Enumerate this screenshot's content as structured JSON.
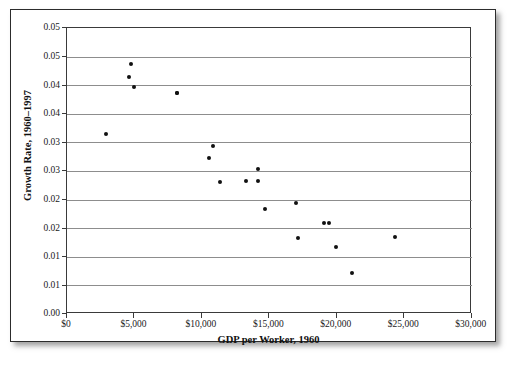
{
  "figure": {
    "frame_color": "#2c2c2c",
    "background": "#ffffff",
    "marker_color": "#111111",
    "grid_color": "#8d8d8d"
  },
  "chart_data": {
    "type": "scatter",
    "title": "",
    "xlabel": "GDP per Worker, 1960",
    "ylabel": "Growth Rate, 1960–1997",
    "xlim": [
      0,
      30000
    ],
    "ylim": [
      0.0,
      0.05
    ],
    "grid": true,
    "legend": "none",
    "xticks": [
      0,
      5000,
      10000,
      15000,
      20000,
      25000,
      30000
    ],
    "xticklabels": [
      "$0",
      "$5,000",
      "$10,000",
      "$15,000",
      "$20,000",
      "$25,000",
      "$30,000"
    ],
    "yticks": [
      0.05,
      0.045,
      0.04,
      0.035,
      0.03,
      0.025,
      0.02,
      0.015,
      0.01,
      0.005,
      0.0
    ],
    "yticklabels": [
      "0.05",
      "0.05",
      "0.04",
      "0.04",
      "0.03",
      "0.03",
      "0.02",
      "0.02",
      "0.01",
      "0.01",
      "0.00"
    ],
    "points": [
      {
        "x": 4830,
        "y": 0.0436
      },
      {
        "x": 8230,
        "y": 0.0385
      },
      {
        "x": 4690,
        "y": 0.0413
      },
      {
        "x": 5060,
        "y": 0.0396
      },
      {
        "x": 8220,
        "y": 0.0386
      },
      {
        "x": 2960,
        "y": 0.0313
      },
      {
        "x": 10920,
        "y": 0.0293
      },
      {
        "x": 10580,
        "y": 0.0271
      },
      {
        "x": 14230,
        "y": 0.0253
      },
      {
        "x": 11440,
        "y": 0.023
      },
      {
        "x": 13370,
        "y": 0.0232
      },
      {
        "x": 14240,
        "y": 0.0232
      },
      {
        "x": 14760,
        "y": 0.0183
      },
      {
        "x": 17080,
        "y": 0.0192
      },
      {
        "x": 19150,
        "y": 0.0158
      },
      {
        "x": 19480,
        "y": 0.0158
      },
      {
        "x": 17200,
        "y": 0.0132
      },
      {
        "x": 20000,
        "y": 0.0116
      },
      {
        "x": 24400,
        "y": 0.0134
      },
      {
        "x": 21190,
        "y": 0.007
      }
    ]
  }
}
